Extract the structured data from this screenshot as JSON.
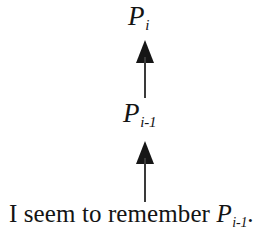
{
  "figure": {
    "type": "vertical-implication-chain",
    "background_color": "#ffffff",
    "ink_color": "#141414",
    "direction": "upward"
  },
  "nodes": {
    "top": {
      "name": "P-sub-i",
      "base": "P",
      "subscript": "i",
      "plain_text": "P_i"
    },
    "middle": {
      "name": "P-sub-i-minus-1",
      "base": "P",
      "subscript": "i-1",
      "plain_text": "P_i-1"
    }
  },
  "arrows": [
    {
      "name": "upper-arrow",
      "from": "P_i-1",
      "to": "P_i",
      "direction": "up",
      "style": "solid-filled-triangle-head",
      "color": "#161616"
    },
    {
      "name": "lower-arrow",
      "from": "I seem to remember P_i-1.",
      "to": "P_i-1",
      "direction": "up",
      "style": "solid-filled-triangle-head",
      "color": "#161616"
    }
  ],
  "caption": {
    "name": "premise-statement",
    "lead_text": "I seem to remember ",
    "var": "P",
    "subscript": "i-1",
    "period": ".",
    "full_text": "I seem to remember P_i-1."
  }
}
